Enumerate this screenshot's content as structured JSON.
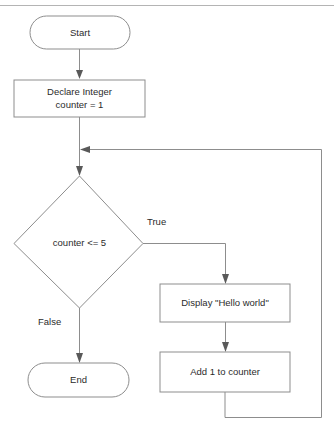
{
  "diagram": {
    "canvas": {
      "width": 334,
      "height": 427
    },
    "colors": {
      "background": "#ffffff",
      "shape_stroke": "#8d8d8d",
      "shape_fill": "#ffffff",
      "text": "#2b2b2b",
      "arrowhead": "#595959",
      "page_rule": "#b4b4b4"
    },
    "nodes": {
      "start": {
        "label": "Start",
        "type": "terminator"
      },
      "declare": {
        "label_line1": "Declare Integer",
        "label_line2": "counter = 1",
        "type": "process"
      },
      "decision": {
        "label": "counter <= 5",
        "type": "decision"
      },
      "display": {
        "label": "Display \"Hello world\"",
        "type": "process"
      },
      "increment": {
        "label": "Add 1 to counter",
        "type": "process"
      },
      "end": {
        "label": "End",
        "type": "terminator"
      }
    },
    "edge_labels": {
      "true_branch": "True",
      "false_branch": "False"
    }
  }
}
